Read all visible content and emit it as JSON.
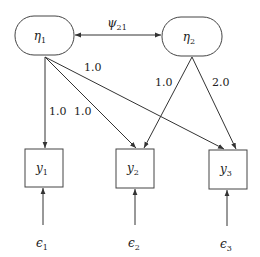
{
  "diagram": {
    "type": "path-diagram",
    "latent": [
      {
        "id": "eta1",
        "symbol": "η",
        "sub": "1"
      },
      {
        "id": "eta2",
        "symbol": "η",
        "sub": "2"
      }
    ],
    "observed": [
      {
        "id": "y1",
        "symbol": "y",
        "sub": "1"
      },
      {
        "id": "y2",
        "symbol": "y",
        "sub": "2"
      },
      {
        "id": "y3",
        "symbol": "y",
        "sub": "3"
      }
    ],
    "errors": [
      {
        "id": "e1",
        "symbol": "ϵ",
        "sub": "1"
      },
      {
        "id": "e2",
        "symbol": "ϵ",
        "sub": "2"
      },
      {
        "id": "e3",
        "symbol": "ϵ",
        "sub": "3"
      }
    ],
    "covariance": {
      "from": "eta1",
      "to": "eta2",
      "symbol": "ψ",
      "sub": "21"
    },
    "loadings": [
      {
        "from": "eta1",
        "to": "y1",
        "label": "1.0"
      },
      {
        "from": "eta1",
        "to": "y2",
        "label": "1.0"
      },
      {
        "from": "eta1",
        "to": "y3",
        "label": "1.0"
      },
      {
        "from": "eta2",
        "to": "y2",
        "label": "1.0"
      },
      {
        "from": "eta2",
        "to": "y3",
        "label": "2.0"
      }
    ]
  }
}
